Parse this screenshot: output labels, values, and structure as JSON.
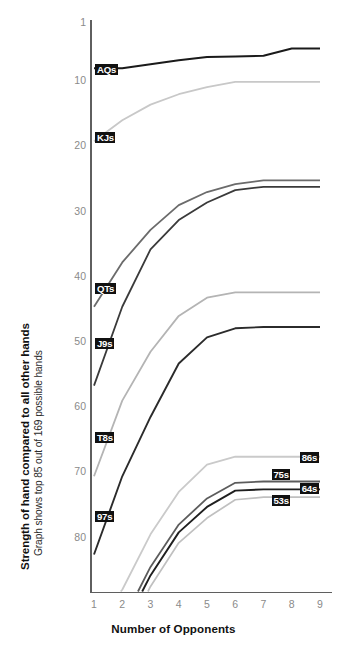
{
  "chart_data": {
    "type": "line",
    "title": "",
    "xlabel": "Number of Opponents",
    "ylabel": "Strength of hand compared to all other hands",
    "ylabel_sub": "Graph shows top 85 out of 169 possible hands",
    "x": [
      1,
      2,
      3,
      4,
      5,
      6,
      7,
      8,
      9
    ],
    "xlim": [
      1,
      9
    ],
    "xticks": [
      "1",
      "2",
      "3",
      "4",
      "5",
      "6",
      "7",
      "8",
      "9"
    ],
    "ylim": [
      1,
      88
    ],
    "y_inverted": true,
    "yticks": [
      "1",
      "10",
      "20",
      "30",
      "40",
      "50",
      "60",
      "70",
      "80"
    ],
    "ytick_values": [
      1,
      10,
      20,
      30,
      40,
      50,
      60,
      70,
      80
    ],
    "grid": false,
    "legend": "inline-labels",
    "series": [
      {
        "name": "AQs",
        "label": "AQs",
        "color": "#1a1a1a",
        "width": 2.0,
        "label_side": "left",
        "label_x": 1.05,
        "label_y": 8.2,
        "values": [
          8.0,
          8.0,
          7.4,
          6.8,
          6.3,
          6.2,
          6.1,
          5.0,
          5.0
        ]
      },
      {
        "name": "KJs",
        "label": "KJs",
        "color": "#c8c8c8",
        "width": 1.8,
        "label_side": "left",
        "label_x": 1.05,
        "label_y": 18.6,
        "values": [
          19.2,
          16.0,
          13.6,
          12.0,
          10.9,
          10.1,
          10.1,
          10.1,
          10.1
        ]
      },
      {
        "name": "QTs",
        "label": "QTs",
        "color": "#6b6b6b",
        "width": 1.8,
        "label_side": "left",
        "label_x": 1.05,
        "label_y": 41.8,
        "values": [
          44.6,
          37.8,
          32.8,
          29.0,
          27.0,
          25.8,
          25.2,
          25.2,
          25.2
        ]
      },
      {
        "name": "J9s",
        "label": "J9s",
        "color": "#3a3a3a",
        "width": 1.8,
        "label_side": "left",
        "label_x": 1.05,
        "label_y": 50.3,
        "values": [
          56.7,
          44.6,
          35.8,
          31.3,
          28.6,
          26.7,
          26.2,
          26.2,
          26.2
        ]
      },
      {
        "name": "T8s",
        "label": "T8s",
        "color": "#b4b4b4",
        "width": 1.8,
        "label_side": "left",
        "label_x": 1.05,
        "label_y": 64.6,
        "values": [
          70.6,
          59.0,
          51.5,
          46.0,
          43.2,
          42.4,
          42.4,
          42.4,
          42.4
        ]
      },
      {
        "name": "97s",
        "label": "97s",
        "color": "#2b2b2b",
        "width": 1.9,
        "label_side": "left",
        "label_x": 1.05,
        "label_y": 76.8,
        "values": [
          82.6,
          70.6,
          61.5,
          53.3,
          49.3,
          47.9,
          47.7,
          47.7,
          47.7
        ]
      },
      {
        "name": "86s",
        "label": "86s",
        "color": "#cacaca",
        "width": 1.8,
        "label_side": "right",
        "label_x": 8.3,
        "label_y": 67.7,
        "values": [
          93.0,
          88.0,
          79.5,
          73.0,
          68.8,
          67.6,
          67.6,
          67.6,
          67.6
        ]
      },
      {
        "name": "75s",
        "label": "75s",
        "color": "#5c5c5c",
        "width": 1.8,
        "label_side": "right",
        "label_x": 7.3,
        "label_y": 70.4,
        "values": [
          98.0,
          93.0,
          84.5,
          78.0,
          74.0,
          71.6,
          71.4,
          71.4,
          71.4
        ]
      },
      {
        "name": "64s",
        "label": "64s",
        "color": "#1f1f1f",
        "width": 1.9,
        "label_side": "right",
        "label_x": 8.3,
        "label_y": 72.4,
        "values": [
          99.0,
          94.2,
          85.8,
          79.2,
          75.3,
          72.8,
          72.6,
          72.6,
          72.6
        ]
      },
      {
        "name": "53s",
        "label": "53s",
        "color": "#c0c0c0",
        "width": 1.7,
        "label_side": "right",
        "label_x": 7.3,
        "label_y": 74.3,
        "values": [
          101.0,
          96.0,
          87.5,
          80.8,
          77.0,
          74.2,
          73.8,
          73.8,
          73.8
        ]
      }
    ]
  },
  "axes": {
    "x_tick_labels": [
      "1",
      "2",
      "3",
      "4",
      "5",
      "6",
      "7",
      "8",
      "9"
    ],
    "y_tick_labels": [
      "1",
      "10",
      "20",
      "30",
      "40",
      "50",
      "60",
      "70",
      "80"
    ],
    "x_axis_title": "Number of Opponents",
    "y_axis_title": "Strength of hand compared to all other hands",
    "y_axis_subtitle": "Graph shows top 85 out of 169 possible hands"
  },
  "colors": {
    "axis": "#5f5f5f",
    "tick_text": "#8a8a8a",
    "title_text": "#111111",
    "label_box_bg": "#111111",
    "label_box_text": "#ffffff",
    "background": "#ffffff"
  }
}
